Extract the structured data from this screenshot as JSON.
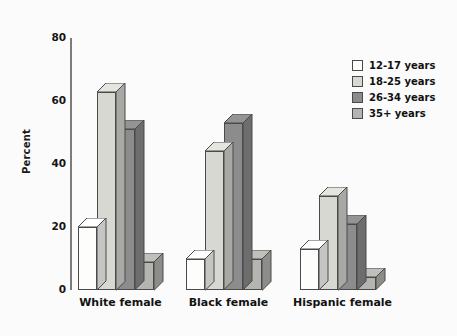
{
  "chart_data": {
    "type": "bar",
    "title": "",
    "xlabel": "",
    "ylabel": "Percent",
    "ylim": [
      0,
      80
    ],
    "yticks": [
      0,
      20,
      40,
      60,
      80
    ],
    "grid": false,
    "legend_position": "top-right",
    "categories": [
      "White female",
      "Black female",
      "Hispanic female"
    ],
    "series": [
      {
        "name": "12-17 years",
        "color": "#fdfdfb",
        "values": [
          20,
          10,
          13
        ]
      },
      {
        "name": "18-25 years",
        "color": "#d8d8d2",
        "values": [
          63,
          44,
          30
        ]
      },
      {
        "name": "26-34 years",
        "color": "#8c8c8c",
        "values": [
          51,
          53,
          21
        ]
      },
      {
        "name": "35+ years",
        "color": "#b4b4b0",
        "values": [
          9,
          10,
          4
        ]
      }
    ]
  },
  "axis": {
    "y_title": "Percent",
    "y_tick_labels": [
      "80",
      "60",
      "40",
      "20",
      "0"
    ]
  },
  "legend": {
    "entries": [
      {
        "label": "12-17 years"
      },
      {
        "label": "18-25 years"
      },
      {
        "label": "26-34 years"
      },
      {
        "label": "35+ years"
      }
    ]
  }
}
